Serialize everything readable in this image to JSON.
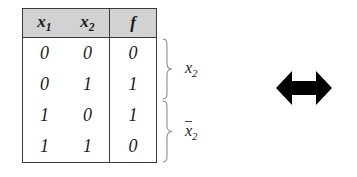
{
  "figure": {
    "kind": "truth-table-with-equivalence-arrow",
    "table": {
      "headers": {
        "col1": {
          "var": "x",
          "sub": "1"
        },
        "col2": {
          "var": "x",
          "sub": "2"
        },
        "col3": {
          "var": "f",
          "sub": ""
        }
      },
      "rows": [
        {
          "x1": "0",
          "x2": "0",
          "f": "0"
        },
        {
          "x1": "0",
          "x2": "1",
          "f": "1"
        },
        {
          "x1": "1",
          "x2": "0",
          "f": "1"
        },
        {
          "x1": "1",
          "x2": "1",
          "f": "0"
        }
      ]
    },
    "annotations": {
      "brace_top": {
        "icon": "curly-brace-right",
        "label_var": "x",
        "label_sub": "2",
        "label_overbar": false,
        "spans_rows": "1-2"
      },
      "brace_bottom": {
        "icon": "curly-brace-right",
        "label_var": "x",
        "label_sub": "2",
        "label_overbar": true,
        "spans_rows": "3-4"
      }
    },
    "arrow": {
      "icon": "double-headed-arrow-horizontal",
      "color": "#000000"
    },
    "colors": {
      "header_fill": "#d2d2d2",
      "border": "#3a3a3a",
      "brace": "#8c8c8c",
      "text": "#1a1a1a",
      "background": "#ffffff"
    }
  }
}
